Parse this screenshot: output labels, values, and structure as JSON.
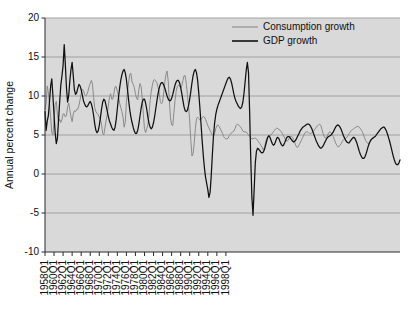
{
  "chart_data": {
    "type": "line",
    "title": "",
    "subtitle": "",
    "xlabel": "",
    "ylabel": "Annual percent change",
    "ylim": [
      -10,
      20
    ],
    "y_ticks": [
      20,
      15,
      10,
      5,
      0,
      -5,
      -10
    ],
    "y_tick_labels": [
      "20",
      "15",
      "10",
      "5",
      "0",
      "-5",
      "-10"
    ],
    "grid": "horizontal",
    "legend_position": "top-right-inside",
    "plot_background": "#d9d9d9",
    "x_tick_labels": [
      "1958Q1",
      "1960Q1",
      "1962Q1",
      "1964Q1",
      "1966Q1",
      "1968Q1",
      "1970Q1",
      "1972Q1",
      "1974Q1",
      "1976Q1",
      "1978Q1",
      "1980Q1",
      "1982Q1",
      "1984Q1",
      "1986Q1",
      "1988Q1",
      "1990Q1",
      "1992Q1",
      "1994Q1",
      "1996Q1",
      "1998Q1"
    ],
    "x_start_label": "1958Q1",
    "x_end_label": "1999Q4",
    "x_tick_step_years": 2,
    "series": [
      {
        "name": "Consumption growth",
        "color": "#8a8a8a",
        "values": [
          8.3,
          9.0,
          11.3,
          10.4,
          9.0,
          7.3,
          5.3,
          5.0,
          6.9,
          8.9,
          9.3,
          7.6,
          6.7,
          7.0,
          6.6,
          7.0,
          7.7,
          7.7,
          7.3,
          7.5,
          8.6,
          9.1,
          8.2,
          7.3,
          6.7,
          7.7,
          8.1,
          8.0,
          8.3,
          8.3,
          8.8,
          9.5,
          10.3,
          10.9,
          10.7,
          10.2,
          10.0,
          10.2,
          10.6,
          11.2,
          11.6,
          12.0,
          11.5,
          9.8,
          8.5,
          8.0,
          7.8,
          7.6,
          7.3,
          7.0,
          6.4,
          5.2,
          5.0,
          5.9,
          6.8,
          7.6,
          8.7,
          9.8,
          10.3,
          9.6,
          9.6,
          10.4,
          11.2,
          11.2,
          10.6,
          10.0,
          9.1,
          8.5,
          8.0,
          7.3,
          6.0,
          6.6,
          9.2,
          10.6,
          11.8,
          12.8,
          12.9,
          11.8,
          11.5,
          11.1,
          10.3,
          9.7,
          9.5,
          10.8,
          11.6,
          11.2,
          9.7,
          7.6,
          5.8,
          5.3,
          5.8,
          6.3,
          7.6,
          9.4,
          10.6,
          11.4,
          12.0,
          12.1,
          11.9,
          11.7,
          11.1,
          10.4,
          9.3,
          9.0,
          9.2,
          10.4,
          11.8,
          12.8,
          13.2,
          11.9,
          9.4,
          7.2,
          6.3,
          6.2,
          7.9,
          9.4,
          10.6,
          11.2,
          11.4,
          11.3,
          11.0,
          11.3,
          12.0,
          12.6,
          12.6,
          11.5,
          10.2,
          8.7,
          6.8,
          4.3,
          2.3,
          2.6,
          4.0,
          5.8,
          7.1,
          7.3,
          7.1,
          6.9,
          7.0,
          7.2,
          7.4,
          7.3,
          7.0,
          6.6,
          6.2,
          5.9,
          5.6,
          5.3,
          5.0,
          4.9,
          5.2,
          5.8,
          6.2,
          6.3,
          6.1,
          5.8,
          5.5,
          5.2,
          4.8,
          4.6,
          4.5,
          4.5,
          4.6,
          4.9,
          5.1,
          5.3,
          5.4,
          5.5,
          5.8,
          6.2,
          6.4,
          6.3,
          6.2,
          6.0,
          5.8,
          5.5,
          5.4,
          5.4,
          5.4,
          5.2,
          5.0,
          4.8,
          4.7,
          4.5,
          4.5,
          4.6,
          4.6,
          4.5,
          4.3,
          4.1,
          3.9,
          3.7,
          3.4,
          3.1,
          3.4,
          4.0,
          4.5,
          4.8,
          4.9,
          5.0,
          5.0,
          5.2,
          5.4,
          5.6,
          5.8,
          5.9,
          5.8,
          5.7,
          5.6,
          5.4,
          5.2,
          4.9,
          4.6,
          4.4,
          4.2,
          4.3,
          4.6,
          4.8,
          4.8,
          4.7,
          4.4,
          4.0,
          3.6,
          3.4,
          3.5,
          3.8,
          4.1,
          4.4,
          4.7,
          5.0,
          5.3,
          5.4,
          5.4,
          5.3,
          5.2,
          5.2,
          5.3,
          5.4,
          5.6,
          5.8,
          6.0,
          6.2,
          6.3,
          6.4,
          6.2,
          5.7,
          5.2,
          4.8,
          4.6,
          4.7,
          5.0,
          5.3,
          5.4,
          5.3,
          5.1,
          4.8,
          4.4,
          4.0,
          3.7,
          3.5,
          3.5,
          3.7,
          3.9,
          4.2,
          4.4,
          4.5,
          4.6,
          4.7,
          4.9,
          5.2,
          5.4,
          5.6,
          5.7,
          5.8,
          5.9,
          6.0,
          6.1,
          6.1,
          6.0,
          5.8,
          5.6,
          5.3,
          4.9,
          4.5,
          4.2,
          4.0,
          3.9,
          4.0,
          4.2,
          4.4
        ]
      },
      {
        "name": "GDP growth",
        "color": "#101010",
        "values": [
          8.0,
          5.6,
          6.8,
          7.5,
          9.3,
          11.3,
          12.2,
          10.0,
          7.6,
          5.2,
          3.9,
          4.6,
          7.0,
          9.3,
          11.4,
          12.6,
          13.9,
          16.6,
          14.0,
          11.0,
          9.2,
          10.1,
          12.0,
          13.4,
          14.3,
          12.6,
          10.8,
          10.2,
          10.4,
          11.0,
          11.5,
          11.3,
          10.8,
          10.1,
          9.4,
          9.0,
          8.7,
          8.6,
          8.8,
          9.1,
          9.3,
          9.0,
          8.4,
          7.5,
          6.4,
          5.6,
          5.3,
          5.5,
          6.2,
          7.2,
          8.3,
          9.2,
          9.6,
          9.4,
          8.8,
          8.1,
          7.4,
          6.8,
          6.4,
          6.0,
          5.7,
          5.6,
          6.0,
          7.0,
          8.4,
          9.8,
          11.0,
          12.0,
          12.7,
          13.2,
          13.4,
          13.0,
          12.1,
          10.8,
          9.4,
          8.2,
          7.3,
          6.6,
          6.0,
          5.5,
          5.2,
          5.2,
          5.6,
          6.4,
          7.4,
          8.4,
          9.2,
          9.6,
          9.6,
          9.1,
          8.3,
          7.3,
          6.5,
          6.0,
          5.8,
          6.0,
          6.6,
          7.4,
          8.4,
          9.4,
          10.3,
          11.0,
          11.5,
          11.7,
          11.7,
          11.4,
          11.0,
          10.5,
          10.0,
          9.6,
          9.4,
          9.4,
          9.7,
          10.2,
          10.8,
          11.4,
          11.8,
          12.0,
          12.0,
          11.7,
          11.1,
          10.3,
          9.4,
          8.6,
          8.1,
          8.0,
          8.2,
          8.8,
          9.6,
          10.6,
          11.7,
          12.6,
          13.2,
          13.4,
          13.0,
          12.0,
          10.4,
          8.5,
          6.4,
          4.3,
          2.4,
          0.8,
          -0.4,
          -1.2,
          -2.0,
          -3.0,
          -2.4,
          -0.3,
          2.4,
          4.8,
          6.5,
          7.6,
          8.3,
          8.8,
          9.2,
          9.6,
          10.0,
          10.4,
          10.8,
          11.2,
          11.6,
          12.0,
          12.3,
          12.4,
          12.2,
          11.7,
          11.0,
          10.3,
          9.7,
          9.3,
          9.0,
          8.7,
          8.5,
          8.4,
          8.6,
          9.2,
          10.3,
          11.8,
          13.3,
          14.3,
          13.0,
          8.0,
          2.0,
          -3.0,
          -5.3,
          -2.0,
          1.4,
          2.9,
          3.3,
          3.2,
          3.0,
          2.8,
          2.7,
          2.8,
          3.1,
          3.6,
          4.2,
          4.7,
          4.9,
          4.7,
          4.3,
          3.9,
          3.7,
          3.8,
          4.2,
          4.6,
          4.7,
          4.5,
          4.1,
          3.8,
          3.6,
          3.7,
          4.0,
          4.4,
          4.7,
          4.8,
          4.8,
          4.6,
          4.4,
          4.2,
          4.1,
          4.2,
          4.4,
          4.7,
          5.0,
          5.3,
          5.6,
          5.8,
          6.0,
          6.1,
          6.2,
          6.3,
          6.4,
          6.4,
          6.3,
          6.1,
          5.8,
          5.4,
          5.0,
          4.6,
          4.2,
          3.9,
          3.6,
          3.4,
          3.3,
          3.4,
          3.6,
          3.9,
          4.2,
          4.5,
          4.7,
          4.8,
          4.9,
          5.0,
          5.2,
          5.4,
          5.7,
          6.0,
          6.2,
          6.3,
          6.2,
          6.0,
          5.7,
          5.3,
          4.9,
          4.6,
          4.3,
          4.1,
          4.0,
          4.0,
          4.2,
          4.4,
          4.6,
          4.7,
          4.6,
          4.3,
          3.9,
          3.4,
          2.9,
          2.5,
          2.2,
          2.0,
          2.0,
          2.2,
          2.6,
          3.1,
          3.6,
          4.0,
          4.3,
          4.5,
          4.6,
          4.7,
          4.8,
          5.0,
          5.2,
          5.4,
          5.6,
          5.8,
          5.9,
          6.0,
          6.0,
          5.8,
          5.5,
          5.1,
          4.6,
          4.1,
          3.5,
          2.9,
          2.3,
          1.8,
          1.4,
          1.2,
          1.2,
          1.4,
          1.8
        ]
      }
    ]
  },
  "legend": {
    "entries": [
      {
        "label": "Consumption growth",
        "color": "#8a8a8a"
      },
      {
        "label": "GDP growth",
        "color": "#101010"
      }
    ]
  }
}
